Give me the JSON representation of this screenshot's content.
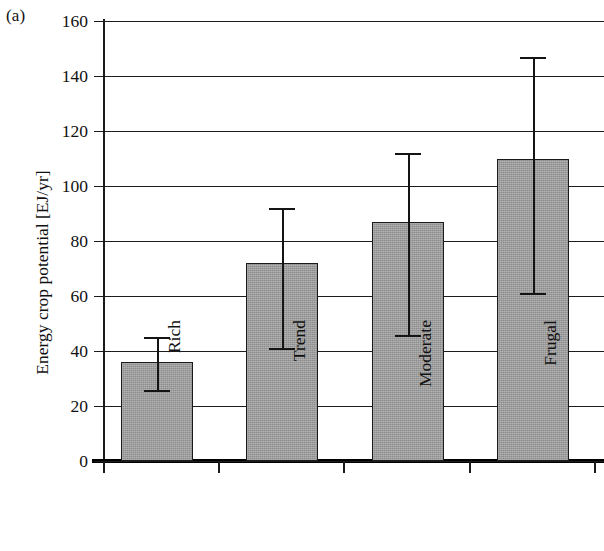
{
  "figure": {
    "panel_label": "(a)",
    "background": "#ffffff",
    "bar_fill_color": "#9b9b9b",
    "line_color": "#1a1a1a"
  },
  "chart_data": {
    "type": "bar",
    "title": "",
    "subtitle": "",
    "panel": "(a)",
    "xlabel": "",
    "ylabel": "Energy crop potential [EJ/yr]",
    "categories": [
      "Rich",
      "Trend",
      "Moderate",
      "Frugal"
    ],
    "values": [
      36,
      72,
      87,
      110
    ],
    "error_low": [
      26,
      41,
      46,
      61
    ],
    "error_high": [
      45,
      92,
      112,
      147
    ],
    "ylim": [
      0,
      160
    ],
    "ytick_labels": [
      "0",
      "20",
      "40",
      "60",
      "80",
      "100",
      "120",
      "140",
      "160"
    ],
    "ytick_values": [
      0,
      20,
      40,
      60,
      80,
      100,
      120,
      140,
      160
    ],
    "grid": "horizontal",
    "legend": "none",
    "series": [
      {
        "name": "Energy crop potential",
        "values": [
          36,
          72,
          87,
          110
        ],
        "error_low": [
          26,
          41,
          46,
          61
        ],
        "error_high": [
          45,
          92,
          112,
          147
        ]
      }
    ]
  }
}
